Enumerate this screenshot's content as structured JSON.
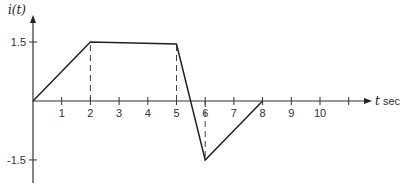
{
  "chart_data": {
    "type": "line",
    "title": "",
    "xlabel": "t sec",
    "ylabel": "i(t)",
    "x_label_var": "t",
    "x_label_unit": "sec",
    "x_ticks": [
      1,
      2,
      3,
      4,
      5,
      6,
      7,
      8,
      9,
      10
    ],
    "x_tick_labels": [
      "1",
      "2",
      "3",
      "4",
      "5",
      "6",
      "7",
      "8",
      "9",
      "10"
    ],
    "y_ticks": [
      1.5,
      -1.5
    ],
    "y_tick_labels": [
      "1.5",
      "-1.5"
    ],
    "xlim": [
      0,
      11.6
    ],
    "ylim": [
      -2.1,
      2.2
    ],
    "grid": false,
    "legend": null,
    "series": [
      {
        "name": "i(t)",
        "x": [
          0,
          2,
          5,
          6,
          8
        ],
        "y": [
          0,
          1.5,
          1.45,
          -1.5,
          0
        ]
      }
    ],
    "dashed_guides": [
      {
        "x": 2,
        "from_y": 0,
        "to_y": 1.5
      },
      {
        "x": 5,
        "from_y": 0,
        "to_y": 1.45
      },
      {
        "x": 6,
        "from_y": 0,
        "to_y": -1.5
      }
    ]
  }
}
